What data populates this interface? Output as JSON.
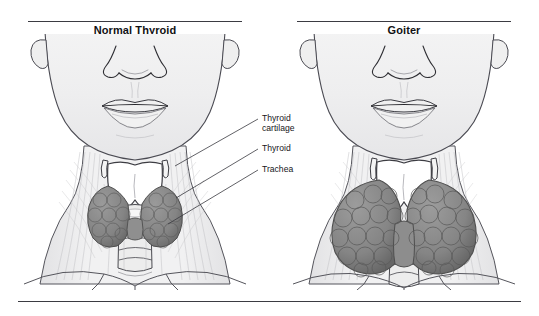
{
  "figure": {
    "panels": [
      {
        "id": "normal",
        "title": "Normal Thyroid"
      },
      {
        "id": "goiter",
        "title": "Goiter"
      }
    ],
    "callouts": [
      {
        "id": "thyroid-cartilage",
        "line1": "Thyroid",
        "line2": "cartilage"
      },
      {
        "id": "thyroid",
        "line1": "Thyroid",
        "line2": ""
      },
      {
        "id": "trachea",
        "line1": "Trachea",
        "line2": ""
      }
    ],
    "colors": {
      "rule": "#3b3b42",
      "text": "#16161a",
      "skin": "#f2f2f2",
      "skin_shade": "#e4e4e6",
      "outline": "#4a4a52",
      "thyroid_tissue": "#8a8a8a",
      "thyroid_tissue_dark": "#6e6e6e",
      "cartilage": "#ffffff",
      "muscle_line": "#b9b9bd"
    }
  }
}
